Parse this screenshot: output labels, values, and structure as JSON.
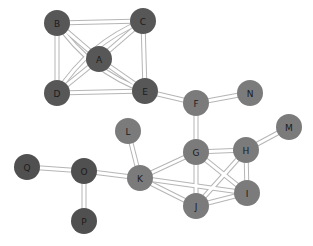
{
  "diagram": {
    "type": "undirected-graph",
    "colors": {
      "dark": "#575757",
      "medium": "#7b7b7b",
      "darkest": "#505050",
      "edge": "#b5b5b5",
      "background": "#ffffff"
    },
    "nodes": [
      {
        "id": "A",
        "label": "A",
        "x": 99,
        "y": 59,
        "r": 13,
        "group": "dark"
      },
      {
        "id": "B",
        "label": "B",
        "x": 57,
        "y": 23,
        "r": 13,
        "group": "dark"
      },
      {
        "id": "C",
        "label": "C",
        "x": 143,
        "y": 21,
        "r": 13,
        "group": "dark"
      },
      {
        "id": "D",
        "label": "D",
        "x": 57,
        "y": 93,
        "r": 13,
        "group": "dark"
      },
      {
        "id": "E",
        "label": "E",
        "x": 145,
        "y": 91,
        "r": 13,
        "group": "dark"
      },
      {
        "id": "F",
        "label": "F",
        "x": 196,
        "y": 103,
        "r": 13,
        "group": "medium"
      },
      {
        "id": "N",
        "label": "N",
        "x": 250,
        "y": 93,
        "r": 13,
        "group": "medium"
      },
      {
        "id": "M",
        "label": "M",
        "x": 289,
        "y": 127,
        "r": 13,
        "group": "medium"
      },
      {
        "id": "G",
        "label": "G",
        "x": 196,
        "y": 152,
        "r": 13,
        "group": "medium"
      },
      {
        "id": "H",
        "label": "H",
        "x": 246,
        "y": 150,
        "r": 13,
        "group": "medium"
      },
      {
        "id": "L",
        "label": "L",
        "x": 128,
        "y": 131,
        "r": 13,
        "group": "medium"
      },
      {
        "id": "K",
        "label": "K",
        "x": 140,
        "y": 178,
        "r": 13,
        "group": "medium"
      },
      {
        "id": "I",
        "label": "I",
        "x": 247,
        "y": 193,
        "r": 13,
        "group": "medium"
      },
      {
        "id": "J",
        "label": "J",
        "x": 196,
        "y": 206,
        "r": 13,
        "group": "medium"
      },
      {
        "id": "Q",
        "label": "Q",
        "x": 27,
        "y": 167,
        "r": 13,
        "group": "darkest"
      },
      {
        "id": "O",
        "label": "O",
        "x": 84,
        "y": 171,
        "r": 13,
        "group": "darkest"
      },
      {
        "id": "P",
        "label": "P",
        "x": 84,
        "y": 221,
        "r": 13,
        "group": "darkest"
      }
    ],
    "edges": [
      {
        "from": "B",
        "to": "C"
      },
      {
        "from": "B",
        "to": "D"
      },
      {
        "from": "B",
        "to": "A"
      },
      {
        "from": "B",
        "to": "E",
        "curve": 18
      },
      {
        "from": "C",
        "to": "E"
      },
      {
        "from": "C",
        "to": "A"
      },
      {
        "from": "C",
        "to": "D",
        "curve": 18
      },
      {
        "from": "D",
        "to": "E"
      },
      {
        "from": "D",
        "to": "A"
      },
      {
        "from": "A",
        "to": "E"
      },
      {
        "from": "E",
        "to": "F"
      },
      {
        "from": "F",
        "to": "N"
      },
      {
        "from": "F",
        "to": "G"
      },
      {
        "from": "G",
        "to": "H"
      },
      {
        "from": "H",
        "to": "M"
      },
      {
        "from": "G",
        "to": "K"
      },
      {
        "from": "G",
        "to": "J"
      },
      {
        "from": "G",
        "to": "I"
      },
      {
        "from": "H",
        "to": "J"
      },
      {
        "from": "H",
        "to": "I"
      },
      {
        "from": "K",
        "to": "I"
      },
      {
        "from": "K",
        "to": "J"
      },
      {
        "from": "J",
        "to": "I"
      },
      {
        "from": "K",
        "to": "L"
      },
      {
        "from": "K",
        "to": "O"
      },
      {
        "from": "O",
        "to": "Q"
      },
      {
        "from": "O",
        "to": "P"
      }
    ]
  }
}
